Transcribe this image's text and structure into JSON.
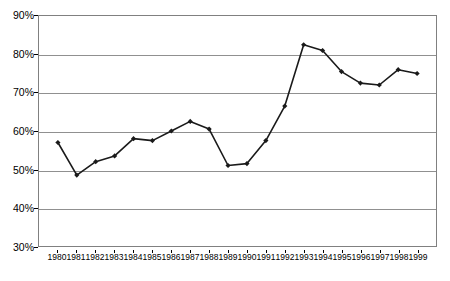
{
  "chart_data": {
    "type": "line",
    "title": "",
    "subtitle": "",
    "xlabel": "",
    "ylabel": "",
    "categories": [
      "1980",
      "1981",
      "1982",
      "1983",
      "1984",
      "1985",
      "1986",
      "1987",
      "1988",
      "1989",
      "1990",
      "1991",
      "1992",
      "1993",
      "1994",
      "1995",
      "1996",
      "1997",
      "1998",
      "1999"
    ],
    "values": [
      57,
      48.5,
      52,
      53.5,
      58,
      57.5,
      60,
      62.5,
      60.5,
      51,
      51.5,
      57.5,
      66.5,
      82.5,
      81,
      75.5,
      72.5,
      72,
      76,
      75
    ],
    "series": [
      {
        "name": "",
        "values": [
          57,
          48.5,
          52,
          53.5,
          58,
          57.5,
          60,
          62.5,
          60.5,
          51,
          51.5,
          57.5,
          66.5,
          82.5,
          81,
          75.5,
          72.5,
          72,
          76,
          75
        ]
      }
    ],
    "ylim": [
      30,
      90
    ],
    "yticks": [
      30,
      40,
      50,
      60,
      70,
      80,
      90
    ],
    "ytick_labels": [
      "30%",
      "40%",
      "50%",
      "60%",
      "70%",
      "80%",
      "90%"
    ],
    "xtick_labels": [
      "1980",
      "1981",
      "1982",
      "1983",
      "1984",
      "1985",
      "1986",
      "1987",
      "1988",
      "1989",
      "1990",
      "1991",
      "1992",
      "1993",
      "1994",
      "1995",
      "1996",
      "1997",
      "1998",
      "1999"
    ],
    "grid": true,
    "legend": false,
    "legend_position": "none",
    "marker": "diamond",
    "line_color": "#1a1a1a",
    "marker_color": "#1a1a1a",
    "grid_color": "#909090",
    "frame_color": "#808080",
    "background_color": "#ffffff"
  }
}
